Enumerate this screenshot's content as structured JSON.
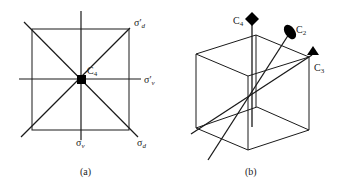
{
  "panel_a": {
    "caption": "(a)",
    "center_label": "C",
    "center_sub": "4",
    "labels": {
      "sigma_prime_d": {
        "main": "σ′",
        "sub": "d"
      },
      "sigma_prime_v": {
        "main": "σ′",
        "sub": "v"
      },
      "sigma_v": {
        "main": "σ",
        "sub": "v"
      },
      "sigma_d": {
        "main": "σ",
        "sub": "d"
      }
    }
  },
  "panel_b": {
    "caption": "(b)",
    "axes": {
      "c4": {
        "main": "C",
        "sub": "4"
      },
      "c2": {
        "main": "C",
        "sub": "2"
      },
      "c3": {
        "main": "C",
        "sub": "3"
      }
    }
  },
  "colors": {
    "line": "#1a1a1a",
    "fill": "#000000",
    "background": "#ffffff"
  }
}
